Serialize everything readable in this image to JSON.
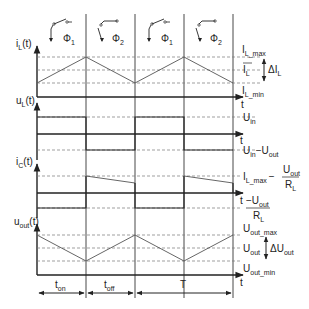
{
  "phases": [
    {
      "label": "Φ",
      "sub": "1",
      "switch": "closed-up"
    },
    {
      "label": "Φ",
      "sub": "2",
      "switch": "open-down"
    },
    {
      "label": "Φ",
      "sub": "1",
      "switch": "closed-up"
    },
    {
      "label": "Φ",
      "sub": "2",
      "switch": "open-down"
    }
  ],
  "plots": {
    "iL": {
      "ylabel": "i",
      "ylabel_sub": "L",
      "ylabel_tail": "(t)",
      "levels": [
        {
          "text": "I",
          "sub": "L_max"
        },
        {
          "text": "I",
          "sub": "L",
          "overline": true
        },
        {
          "text": "I",
          "sub": "L_min"
        }
      ],
      "delta": {
        "text": "ΔI",
        "sub": "L"
      },
      "xaxis": "t"
    },
    "uL": {
      "ylabel": "u",
      "ylabel_sub": "L",
      "ylabel_tail": "(t)",
      "levels": [
        {
          "text": "U",
          "sub": "in"
        },
        {
          "text": "U",
          "sub": "in",
          "text2": "−U",
          "sub2": "out"
        }
      ],
      "xaxis": "t"
    },
    "iC": {
      "ylabel": "i",
      "ylabel_sub": "C",
      "ylabel_tail": "(t)",
      "levels": [
        {
          "text": "I",
          "sub": "L_max",
          "minus": "−",
          "num": "U",
          "num_sub": "out",
          "den": "R",
          "den_sub": "L"
        },
        {
          "minus": "−",
          "num": "U",
          "num_sub": "out",
          "den": "R",
          "den_sub": "L"
        }
      ],
      "xaxis": "t"
    },
    "uout": {
      "ylabel": "u",
      "ylabel_sub": "out",
      "ylabel_tail": "(t)",
      "levels": [
        {
          "text": "U",
          "sub": "out_max"
        },
        {
          "text": "U",
          "sub": "out"
        },
        {
          "text": "U",
          "sub": "out_min"
        }
      ],
      "delta": {
        "text": "ΔU",
        "sub": "out"
      },
      "xaxis": "t"
    }
  },
  "timing": {
    "ton": {
      "text": "t",
      "sub": "on"
    },
    "toff": {
      "text": "t",
      "sub": "off"
    },
    "period": {
      "text": "T"
    }
  }
}
